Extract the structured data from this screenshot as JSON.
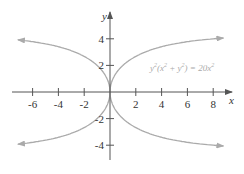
{
  "chart_data": {
    "type": "line",
    "title": "",
    "equation": "y²(x² + y²) = 20x²",
    "equation_parts": {
      "y2": "y",
      "exp": "2",
      "open": "(",
      "x": "x",
      "plus": " + ",
      "y": "y",
      "close": ")",
      "eq": " = 20",
      "xr": "x"
    },
    "xlabel": "x",
    "ylabel": "y",
    "xlim": [
      -7.5,
      9.5
    ],
    "ylim": [
      -5,
      6
    ],
    "x_ticks": [
      -6,
      -4,
      -2,
      2,
      4,
      6,
      8
    ],
    "x_tick_labels": [
      "-6",
      "-4",
      "-2",
      "2",
      "4",
      "6",
      "8"
    ],
    "y_ticks": [
      4,
      2,
      -2,
      -4
    ],
    "y_tick_labels": [
      "4",
      "2",
      "-2",
      "-4"
    ],
    "asymptotes": [
      4.472,
      -4.472
    ],
    "grid": false,
    "curve_color": "#aaaaaa",
    "axis_color": "#555555",
    "series": [
      {
        "name": "upper-right branch",
        "x": [
          0,
          0.05,
          0.2,
          0.48,
          0.95,
          1.79,
          3.2,
          5.5,
          9.0
        ],
        "y": [
          0,
          0.98,
          1.47,
          2.0,
          2.5,
          3.0,
          3.5,
          3.85,
          4.1
        ]
      },
      {
        "name": "upper-left branch",
        "x": [
          0,
          -0.05,
          -0.2,
          -0.48,
          -0.95,
          -1.79,
          -3.2,
          -5.5,
          -7.2
        ],
        "y": [
          0,
          0.98,
          1.47,
          2.0,
          2.5,
          3.0,
          3.5,
          3.85,
          4.0
        ]
      },
      {
        "name": "lower-right branch",
        "x": [
          0,
          0.05,
          0.2,
          0.48,
          0.95,
          1.79,
          3.2,
          5.5,
          9.0
        ],
        "y": [
          0,
          -0.98,
          -1.47,
          -2.0,
          -2.5,
          -3.0,
          -3.5,
          -3.85,
          -4.1
        ]
      },
      {
        "name": "lower-left branch",
        "x": [
          0,
          -0.05,
          -0.2,
          -0.48,
          -0.95,
          -1.79,
          -3.2,
          -5.5,
          -7.2
        ],
        "y": [
          0,
          -0.98,
          -1.47,
          -2.0,
          -2.5,
          -3.0,
          -3.5,
          -3.85,
          -4.0
        ]
      }
    ]
  }
}
